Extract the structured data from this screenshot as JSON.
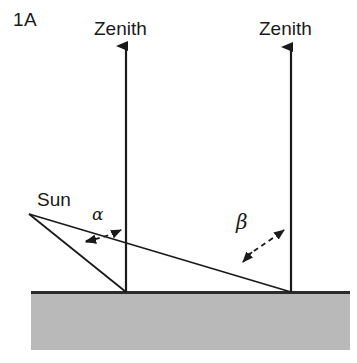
{
  "figure": {
    "panel_label": "1A",
    "background_color": "#ffffff",
    "line_color": "#1a1a1a",
    "ground_fill_color": "#b9b9b9",
    "ground_edge_color": "#2b2b2b"
  },
  "labels": {
    "zenith_left": "Zenith",
    "zenith_right": "Zenith",
    "sun": "Sun",
    "alpha": "α",
    "beta": "β"
  },
  "geometry": {
    "sun_vertex": {
      "x": 29,
      "y": 214
    },
    "ground": {
      "x": 31,
      "y": 292,
      "width": 319,
      "height": 58
    },
    "zenith_arrow_left": {
      "x": 126,
      "y_tip": 44,
      "y_base": 292
    },
    "zenith_arrow_right": {
      "x": 291,
      "y_tip": 45,
      "y_base": 292
    },
    "sun_ray_steep": {
      "x1": 29,
      "y1": 214,
      "x2": 126,
      "y2": 292
    },
    "sun_ray_shallow": {
      "x1": 29,
      "y1": 214,
      "x2": 291,
      "y2": 292
    },
    "alpha_arc": {
      "start_x": 82,
      "start_y": 243,
      "end_x": 124,
      "end_y": 229
    },
    "beta_arc": {
      "start_x": 238,
      "start_y": 265,
      "end_x": 289,
      "end_y": 229
    }
  }
}
